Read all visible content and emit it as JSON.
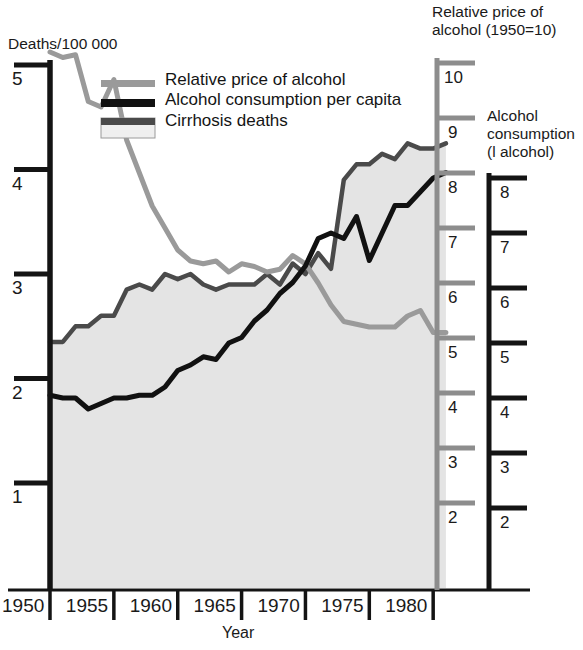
{
  "figure": {
    "left_axis_title": "Deaths/100 000",
    "right_axis_title_1": "Relative price of",
    "right_axis_title_2": "alcohol (1950=10)",
    "right_axis_title_3": "Alcohol",
    "right_axis_title_4": "consumption",
    "right_axis_title_5": "(l alcohol)",
    "x_axis_label": "Year"
  },
  "legend": {
    "items": [
      {
        "label": "Relative price of alcohol",
        "swatch": "gray-line",
        "color": "#9a9a9a"
      },
      {
        "label": "Alcohol consumption per capita",
        "swatch": "black-line",
        "color": "#111111"
      },
      {
        "label": "Cirrhosis deaths",
        "swatch": "filled-area-box",
        "color": "#e2e2e2"
      }
    ]
  },
  "colors": {
    "price_line": "#9a9a9a",
    "consumption_line": "#111111",
    "cirrhosis_area_fill": "#e4e4e4",
    "cirrhosis_area_edge": "#4a4a4a",
    "axis_black": "#141414",
    "axis_gray": "#8d8d8d"
  },
  "axes": {
    "left": {
      "title": "Deaths/100 000",
      "ticks": [
        "1",
        "2",
        "3",
        "4",
        "5"
      ],
      "min": 0,
      "max": 5.4
    },
    "right_gray": {
      "title": "Relative price of alcohol (1950=10)",
      "ticks": [
        "2",
        "3",
        "4",
        "5",
        "6",
        "7",
        "8",
        "9",
        "10"
      ],
      "min": 1.2,
      "max": 10.2
    },
    "right_black": {
      "title": "Alcohol consumption (l alcohol)",
      "ticks": [
        "2",
        "3",
        "4",
        "5",
        "6",
        "7",
        "8"
      ],
      "min": 1.2,
      "max": 8.2
    },
    "x": {
      "label": "Year",
      "ticks": [
        "1950",
        "1955",
        "1960",
        "1965",
        "1970",
        "1975",
        "1980"
      ],
      "min": 1950,
      "max": 1980.3
    }
  },
  "chart_data": {
    "type": "line",
    "title": "",
    "xlabel": "Year",
    "ylabel": "Deaths/100 000",
    "grid": false,
    "legend_position": "top-left-inside",
    "xlim": [
      1950,
      1980.3
    ],
    "left_ylim": [
      0,
      5.4
    ],
    "right_gray_ylim": [
      1.2,
      10.2
    ],
    "right_black_ylim": [
      1.2,
      8.2
    ],
    "x": [
      1950,
      1951,
      1952,
      1953,
      1954,
      1955,
      1956,
      1957,
      1958,
      1959,
      1960,
      1961,
      1962,
      1963,
      1964,
      1965,
      1966,
      1967,
      1968,
      1969,
      1970,
      1971,
      1972,
      1973,
      1974,
      1975,
      1976,
      1977,
      1978,
      1979,
      1980,
      1981
    ],
    "series": [
      {
        "name": "Relative price of alcohol",
        "axis": "right_gray",
        "units": "index (1950=10)",
        "color": "#9a9a9a",
        "values": [
          10.2,
          10.1,
          10.15,
          9.3,
          9.2,
          9.7,
          8.6,
          8.0,
          7.4,
          7.0,
          6.6,
          6.4,
          6.35,
          6.4,
          6.2,
          6.35,
          6.3,
          6.2,
          6.25,
          6.5,
          6.35,
          6.0,
          5.6,
          5.3,
          5.25,
          5.2,
          5.2,
          5.2,
          5.4,
          5.5,
          5.1,
          5.1
        ]
      },
      {
        "name": "Alcohol consumption per capita",
        "axis": "right_black",
        "units": "l alcohol",
        "color": "#111111",
        "values": [
          4.05,
          4.0,
          4.0,
          3.8,
          3.9,
          4.0,
          4.0,
          4.05,
          4.05,
          4.2,
          4.5,
          4.6,
          4.75,
          4.7,
          5.0,
          5.1,
          5.4,
          5.6,
          5.9,
          6.1,
          6.4,
          6.9,
          7.0,
          6.9,
          7.3,
          6.5,
          7.0,
          7.5,
          7.5,
          7.75,
          8.0,
          8.1
        ]
      },
      {
        "name": "Cirrhosis deaths",
        "axis": "left",
        "units": "deaths/100 000",
        "color": "#4a4a4a",
        "fill": "#e4e4e4",
        "values": [
          2.35,
          2.35,
          2.5,
          2.5,
          2.6,
          2.6,
          2.85,
          2.9,
          2.85,
          3.0,
          2.95,
          3.0,
          2.9,
          2.85,
          2.9,
          2.9,
          2.9,
          3.0,
          2.9,
          3.1,
          3.0,
          3.2,
          3.05,
          3.9,
          4.05,
          4.05,
          4.15,
          4.1,
          4.25,
          4.2,
          4.2,
          4.25
        ]
      }
    ]
  }
}
